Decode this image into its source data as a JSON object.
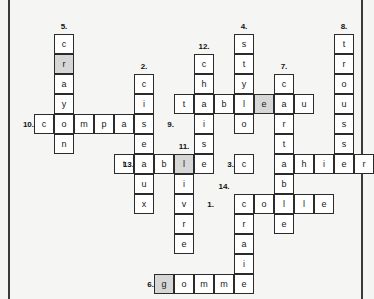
{
  "puzzle": {
    "type": "crossword",
    "title": "",
    "cell_size": 20,
    "origin": {
      "x": 14,
      "y": 14
    },
    "theme": {
      "page_background": "#f5f5f3",
      "cell_background": "#ffffff",
      "cell_shaded_background": "#d6d6d6",
      "cell_border": "#2b2b2b",
      "text_color": "#1a1a1a",
      "page_edge_color": "#3a3a3a"
    },
    "entries": [
      {
        "number": "1.",
        "answer": "colle",
        "direction": "across",
        "row": 9,
        "col": 10,
        "label_row": 9,
        "label_col": 9
      },
      {
        "number": "2.",
        "answer": "ciseaux",
        "direction": "down",
        "row": 3,
        "col": 6,
        "label_row": 2,
        "label_col": 6
      },
      {
        "number": "3.",
        "answer": "cahier",
        "direction": "across",
        "row": 7,
        "col": 11,
        "label_row": 7,
        "label_col": 10
      },
      {
        "number": "4.",
        "answer": "stylo",
        "direction": "down",
        "row": 1,
        "col": 11,
        "label_row": 0,
        "label_col": 11
      },
      {
        "number": "5.",
        "answer": "crayon",
        "direction": "down",
        "row": 1,
        "col": 2,
        "label_row": 0,
        "label_col": 2
      },
      {
        "number": "6.",
        "answer": "gomme",
        "direction": "across",
        "row": 13,
        "col": 7,
        "label_row": 13,
        "label_col": 6
      },
      {
        "number": "7.",
        "answer": "cartable",
        "direction": "down",
        "row": 3,
        "col": 13,
        "label_row": 2,
        "label_col": 13
      },
      {
        "number": "8.",
        "answer": "trousse",
        "direction": "down",
        "row": 1,
        "col": 16,
        "label_row": 0,
        "label_col": 16
      },
      {
        "number": "9.",
        "answer": "tableau",
        "direction": "across",
        "row": 5,
        "col": 8,
        "label_row": 5,
        "label_col": 7
      },
      {
        "number": "10.",
        "answer": "compas",
        "direction": "across",
        "row": 5,
        "col": 1,
        "label_row": 5,
        "label_col": 0
      },
      {
        "number": "11.",
        "answer": "livre",
        "direction": "down",
        "row": 7,
        "col": 9,
        "label_row": 6,
        "label_col": 8
      },
      {
        "number": "12.",
        "answer": "chaise",
        "direction": "down",
        "row": 2,
        "col": 9,
        "label_row": 1,
        "label_col": 9
      },
      {
        "number": "13.",
        "answer": "table",
        "direction": "across",
        "row": 7,
        "col": 6,
        "label_row": 7,
        "label_col": 5
      },
      {
        "number": "14.",
        "answer": "craie",
        "direction": "down",
        "row": 9,
        "col": 10,
        "label_row": 8,
        "label_col": 10
      }
    ],
    "cells": [
      {
        "letter": "c",
        "row": 1,
        "col": 2,
        "shaded": false
      },
      {
        "letter": "r",
        "row": 2,
        "col": 2,
        "shaded": true
      },
      {
        "letter": "a",
        "row": 3,
        "col": 2,
        "shaded": false
      },
      {
        "letter": "y",
        "row": 4,
        "col": 2,
        "shaded": false
      },
      {
        "letter": "o",
        "row": 5,
        "col": 2,
        "shaded": false
      },
      {
        "letter": "n",
        "row": 6,
        "col": 2,
        "shaded": false
      },
      {
        "letter": "c",
        "row": 5,
        "col": 1,
        "shaded": false
      },
      {
        "letter": "m",
        "row": 5,
        "col": 3,
        "shaded": false
      },
      {
        "letter": "p",
        "row": 5,
        "col": 4,
        "shaded": false
      },
      {
        "letter": "a",
        "row": 5,
        "col": 5,
        "shaded": false
      },
      {
        "letter": "c",
        "row": 3,
        "col": 6,
        "shaded": false
      },
      {
        "letter": "i",
        "row": 4,
        "col": 6,
        "shaded": false
      },
      {
        "letter": "s",
        "row": 5,
        "col": 6,
        "shaded": false
      },
      {
        "letter": "e",
        "row": 6,
        "col": 6,
        "shaded": false
      },
      {
        "letter": "a",
        "row": 7,
        "col": 6,
        "shaded": false
      },
      {
        "letter": "u",
        "row": 8,
        "col": 6,
        "shaded": false
      },
      {
        "letter": "x",
        "row": 9,
        "col": 6,
        "shaded": false
      },
      {
        "letter": "t",
        "row": 7,
        "col": 5,
        "shaded": false
      },
      {
        "letter": "b",
        "row": 7,
        "col": 7,
        "shaded": false
      },
      {
        "letter": "l",
        "row": 7,
        "col": 8,
        "shaded": true
      },
      {
        "letter": "e",
        "row": 7,
        "col": 9,
        "shaded": false
      },
      {
        "letter": "i",
        "row": 8,
        "col": 8,
        "shaded": false
      },
      {
        "letter": "v",
        "row": 9,
        "col": 8,
        "shaded": false
      },
      {
        "letter": "r",
        "row": 10,
        "col": 8,
        "shaded": false
      },
      {
        "letter": "e",
        "row": 11,
        "col": 8,
        "shaded": false
      },
      {
        "letter": "c",
        "row": 2,
        "col": 9,
        "shaded": false
      },
      {
        "letter": "h",
        "row": 3,
        "col": 9,
        "shaded": false
      },
      {
        "letter": "a",
        "row": 4,
        "col": 9,
        "shaded": false
      },
      {
        "letter": "i",
        "row": 5,
        "col": 9,
        "shaded": false
      },
      {
        "letter": "s",
        "row": 6,
        "col": 9,
        "shaded": false
      },
      {
        "letter": "t",
        "row": 4,
        "col": 8,
        "shaded": false
      },
      {
        "letter": "b",
        "row": 4,
        "col": 10,
        "shaded": false
      },
      {
        "letter": "l",
        "row": 4,
        "col": 11,
        "shaded": false
      },
      {
        "letter": "e",
        "row": 4,
        "col": 12,
        "shaded": true
      },
      {
        "letter": "a",
        "row": 4,
        "col": 13,
        "shaded": false
      },
      {
        "letter": "u",
        "row": 4,
        "col": 14,
        "shaded": false
      },
      {
        "letter": "s",
        "row": 1,
        "col": 11,
        "shaded": false
      },
      {
        "letter": "t",
        "row": 2,
        "col": 11,
        "shaded": false
      },
      {
        "letter": "y",
        "row": 3,
        "col": 11,
        "shaded": false
      },
      {
        "letter": "o",
        "row": 5,
        "col": 11,
        "shaded": false
      },
      {
        "letter": "c",
        "row": 3,
        "col": 13,
        "shaded": false
      },
      {
        "letter": "r",
        "row": 5,
        "col": 13,
        "shaded": false
      },
      {
        "letter": "t",
        "row": 6,
        "col": 13,
        "shaded": false
      },
      {
        "letter": "a",
        "row": 7,
        "col": 13,
        "shaded": false
      },
      {
        "letter": "b",
        "row": 8,
        "col": 13,
        "shaded": false
      },
      {
        "letter": "l",
        "row": 9,
        "col": 13,
        "shaded": false
      },
      {
        "letter": "e",
        "row": 10,
        "col": 13,
        "shaded": false
      },
      {
        "letter": "c",
        "row": 7,
        "col": 11,
        "shaded": false
      },
      {
        "letter": "h",
        "row": 7,
        "col": 14,
        "shaded": false
      },
      {
        "letter": "i",
        "row": 7,
        "col": 15,
        "shaded": false
      },
      {
        "letter": "e",
        "row": 7,
        "col": 16,
        "shaded": false
      },
      {
        "letter": "r",
        "row": 7,
        "col": 17,
        "shaded": false
      },
      {
        "letter": "t",
        "row": 1,
        "col": 16,
        "shaded": false
      },
      {
        "letter": "r",
        "row": 2,
        "col": 16,
        "shaded": false
      },
      {
        "letter": "o",
        "row": 3,
        "col": 16,
        "shaded": false
      },
      {
        "letter": "u",
        "row": 4,
        "col": 16,
        "shaded": false
      },
      {
        "letter": "s",
        "row": 5,
        "col": 16,
        "shaded": false
      },
      {
        "letter": "s",
        "row": 6,
        "col": 16,
        "shaded": false
      },
      {
        "letter": "c",
        "row": 9,
        "col": 11,
        "shaded": false
      },
      {
        "letter": "o",
        "row": 9,
        "col": 12,
        "shaded": false
      },
      {
        "letter": "l",
        "row": 9,
        "col": 14,
        "shaded": false
      },
      {
        "letter": "e",
        "row": 9,
        "col": 15,
        "shaded": false
      },
      {
        "letter": "r",
        "row": 10,
        "col": 11,
        "shaded": false
      },
      {
        "letter": "a",
        "row": 11,
        "col": 11,
        "shaded": false
      },
      {
        "letter": "i",
        "row": 12,
        "col": 11,
        "shaded": false
      },
      {
        "letter": "e",
        "row": 13,
        "col": 11,
        "shaded": false
      },
      {
        "letter": "g",
        "row": 13,
        "col": 7,
        "shaded": true
      },
      {
        "letter": "o",
        "row": 13,
        "col": 8,
        "shaded": false
      },
      {
        "letter": "m",
        "row": 13,
        "col": 9,
        "shaded": false
      },
      {
        "letter": "m",
        "row": 13,
        "col": 10,
        "shaded": false
      }
    ]
  }
}
